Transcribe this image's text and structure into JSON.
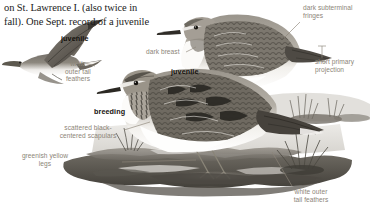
{
  "page": {
    "kind": "field-guide-plate",
    "background": "#ffffff",
    "label_color": "#8c8578",
    "bold_label_color": "#14110c",
    "body_text_color": "#1b1b1b"
  },
  "intro_text": {
    "lines": [
      "on St. Lawrence I. (also twice in",
      "fall). One Sept. record of a juvenile"
    ]
  },
  "labels": {
    "juvenile_flight": "juvenile",
    "white_outer_tail_feathers_flight": "white\nouter tail\nfeathers",
    "dark_breast": "dark breast",
    "juvenile_standing": "juvenile",
    "dark_subterminal_fringes": "dark subterminal\nfringes",
    "short_primary_projection": "short primary\nprojection",
    "breeding": "breeding",
    "scattered_black_centered_scapulars": "scattered black-\ncentered scapulars",
    "greenish_yellow_legs": "greenish yellow\nlegs",
    "white_outer_tail_feathers_breeding": "white outer\ntail feathers"
  },
  "figures": {
    "flying_bird": "sandpiper-in-flight",
    "standing_juvenile": "sandpiper-juvenile-standing",
    "standing_breeding": "sandpiper-breeding-standing",
    "habitat": "marsh-mudflat-with-grass"
  }
}
